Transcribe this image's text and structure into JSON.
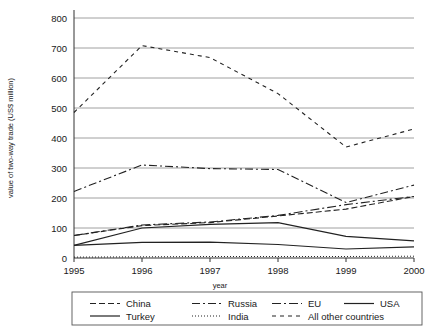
{
  "chart_data": {
    "type": "line",
    "title": "",
    "xlabel": "year",
    "ylabel": "value of two-way trade (US$ million)",
    "x": [
      1995,
      1996,
      1997,
      1998,
      1999,
      2000
    ],
    "xticklabels": [
      "1995",
      "1996",
      "1997",
      "1998",
      "1999",
      "2000"
    ],
    "yticklabels": [
      "0",
      "100",
      "200",
      "300",
      "400",
      "500",
      "600",
      "700",
      "800"
    ],
    "yticks": [
      0,
      100,
      200,
      300,
      400,
      500,
      600,
      700,
      800
    ],
    "ylim": [
      0,
      800
    ],
    "xlim": [
      1995,
      2000
    ],
    "grid": "horizontal",
    "legend_position": "bottom",
    "series": [
      {
        "name": "China",
        "dash": "6,3",
        "values": [
          75,
          108,
          118,
          140,
          163,
          205
        ]
      },
      {
        "name": "Russia",
        "dash": "8,3,2,3",
        "values": [
          222,
          310,
          298,
          295,
          185,
          243
        ]
      },
      {
        "name": "EU",
        "dash": "9,3,2,3",
        "values": [
          75,
          110,
          120,
          142,
          178,
          205
        ]
      },
      {
        "name": "USA",
        "dash": "none",
        "values": [
          42,
          100,
          112,
          118,
          72,
          57
        ]
      },
      {
        "name": "Turkey",
        "dash": "none",
        "values": [
          42,
          52,
          53,
          45,
          30,
          37
        ]
      },
      {
        "name": "India",
        "dash": "1,2",
        "values": [
          3,
          4,
          5,
          5,
          5,
          6
        ]
      },
      {
        "name": "All other countries",
        "dash": "4,4",
        "values": [
          485,
          708,
          668,
          548,
          370,
          430
        ]
      }
    ],
    "extra_points": {
      "China": [
        [
          1995,
          75
        ],
        [
          1996,
          108
        ],
        [
          1997,
          118
        ],
        [
          1998,
          140
        ],
        [
          1999,
          163
        ],
        [
          2000,
          205
        ]
      ],
      "USA": [
        [
          1995,
          42
        ],
        [
          1996,
          100
        ],
        [
          1997,
          112
        ],
        [
          1998,
          118
        ],
        [
          1999,
          72
        ],
        [
          2000,
          57
        ]
      ],
      "Turkey": [
        [
          1995,
          42
        ],
        [
          1996,
          52
        ],
        [
          1997,
          53
        ],
        [
          1998,
          45
        ],
        [
          1999,
          30
        ],
        [
          2000,
          37
        ]
      ]
    }
  },
  "legend": {
    "items": [
      {
        "label": "China"
      },
      {
        "label": "Russia"
      },
      {
        "label": "EU"
      },
      {
        "label": "USA"
      },
      {
        "label": "Turkey"
      },
      {
        "label": "India"
      },
      {
        "label": "All other countries"
      }
    ]
  },
  "colors": {
    "line": "#222222",
    "grid": "#888888",
    "axis": "#333333",
    "background": "#ffffff"
  }
}
